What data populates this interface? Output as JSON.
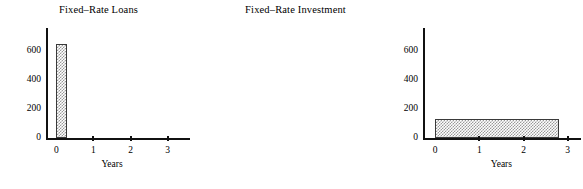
{
  "figure": {
    "background": "#ffffff",
    "foreground": "#111111",
    "bar_fill_color": "#9a9a9a",
    "bar_edge_color": "#3a3a3a"
  },
  "chart_data": [
    {
      "type": "bar",
      "title": "Fixed–Rate Loans",
      "xlabel": "Years",
      "ylabel": "",
      "xlim": [
        -0.25,
        3.6
      ],
      "ylim": [
        0,
        760
      ],
      "grid": false,
      "legend": null,
      "xticks": [
        0,
        1,
        2,
        3
      ],
      "xtick_labels": [
        "0",
        "1",
        "2",
        "3"
      ],
      "yticks": [
        0,
        200,
        400,
        600
      ],
      "ytick_labels": [
        "0",
        "200",
        "400",
        "600"
      ],
      "bars": [
        {
          "label": "loan",
          "x_start": 0,
          "x_end": 0.3,
          "value": 650
        }
      ]
    },
    {
      "type": "bar",
      "title": "Fixed–Rate Investment",
      "xlabel": "Years",
      "ylabel": "",
      "xlim": [
        -0.25,
        3.3
      ],
      "ylim": [
        0,
        760
      ],
      "grid": false,
      "legend": null,
      "xticks": [
        0,
        1,
        2,
        3
      ],
      "xtick_labels": [
        "0",
        "1",
        "2",
        "3"
      ],
      "yticks": [
        0,
        200,
        400,
        600
      ],
      "ytick_labels": [
        "0",
        "200",
        "400",
        "600"
      ],
      "bars": [
        {
          "label": "investment",
          "x_start": 0,
          "x_end": 2.8,
          "value": 130
        }
      ]
    }
  ]
}
